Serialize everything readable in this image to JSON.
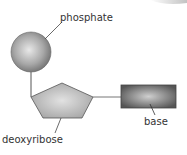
{
  "diagram": {
    "labels": {
      "phosphate": "phosphate",
      "sugar": "deoxyribose",
      "base": "base"
    },
    "colors": {
      "phosphate_fill": "#9a9a9a",
      "sugar_fill": "#b5b5b5",
      "base_fill": "#6a6a6a",
      "line": "#555555",
      "text": "#333333"
    }
  }
}
